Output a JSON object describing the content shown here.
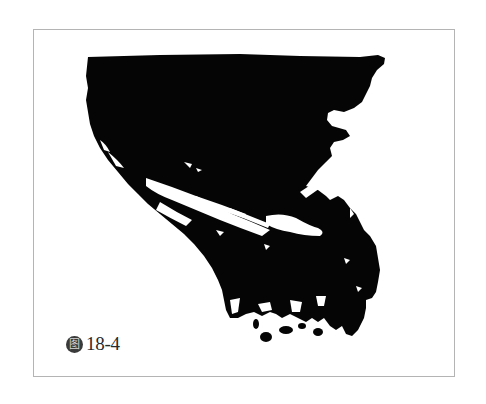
{
  "figure": {
    "caption": {
      "icon_glyph": "图",
      "icon_name": "figure-label-icon",
      "number": "18-4"
    },
    "frame_border_color": "#b4b4b4",
    "ink_color": "#050505",
    "paper_color": "#ffffff"
  }
}
